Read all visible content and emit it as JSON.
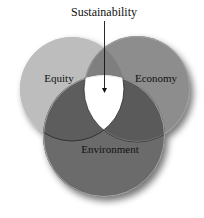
{
  "diagram": {
    "type": "venn",
    "title": "Sustainability",
    "sets": [
      {
        "id": "equity",
        "label": "Equity",
        "color": "#bdbdbd"
      },
      {
        "id": "economy",
        "label": "Economy",
        "color": "#8d8d8d"
      },
      {
        "id": "environment",
        "label": "Environment",
        "color": "#6b6b6b"
      }
    ],
    "intersections": {
      "equity_economy": {
        "color": "#7f7f7f"
      },
      "equity_environment": {
        "color": "#5d5d5d"
      },
      "economy_environment": {
        "color": "#5a5a5a"
      },
      "all_three": {
        "label": "Sustainability",
        "color": "#ffffff"
      }
    },
    "annotation": {
      "text": "Sustainability",
      "points_to": "all_three",
      "style": "arrow-down"
    }
  }
}
